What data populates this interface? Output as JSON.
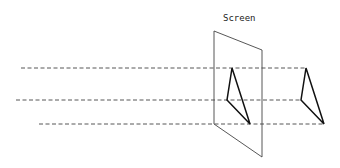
{
  "diagram": {
    "title": "Screen",
    "colors": {
      "background": "#ffffff",
      "screen_outline": "#444444",
      "projection_lines": "#444444",
      "triangle": "#111111",
      "label": "#222222"
    },
    "screen": {
      "label": "Screen",
      "label_pos": [
        223,
        21
      ],
      "corners": [
        [
          214,
          31
        ],
        [
          262,
          50
        ],
        [
          262,
          157
        ],
        [
          214,
          124
        ]
      ]
    },
    "projection_lines": [
      {
        "y": 68,
        "x_start": 21,
        "x_end": 306
      },
      {
        "y": 100,
        "x_start": 16,
        "x_end": 301
      },
      {
        "y": 124,
        "x_start": 39,
        "x_end": 324
      }
    ],
    "triangles": [
      {
        "name": "projected-triangle-on-screen",
        "points": [
          [
            232,
            68
          ],
          [
            227,
            100
          ],
          [
            250,
            124
          ]
        ]
      },
      {
        "name": "source-triangle",
        "points": [
          [
            306,
            68
          ],
          [
            301,
            100
          ],
          [
            324,
            124
          ]
        ]
      }
    ]
  }
}
